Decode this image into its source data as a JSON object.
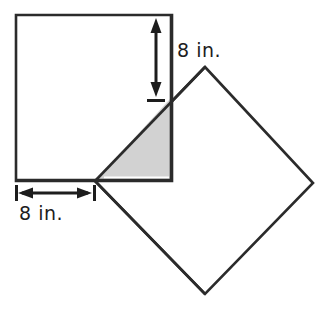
{
  "figure": {
    "background_color": "#ffffff",
    "stroke_color": "#2b2b2b",
    "shaded_fill_color": "#d2d2d2",
    "labels": {
      "vertical_dimension": "8 in.",
      "horizontal_dimension": "8 in."
    },
    "shapes": {
      "upright_square": {
        "name": "upright-square",
        "fill": "#ffffff",
        "stroke": "#2b2b2b",
        "points": "16,15 172,15 172,181 16,181"
      },
      "rotated_square": {
        "name": "rotated-square-diamond",
        "fill": "#ffffff",
        "stroke": "#2b2b2b",
        "points": "205,67 313,183 205,294 95,181"
      },
      "shaded_triangle": {
        "name": "shaded-overlap-triangle",
        "fill": "#d2d2d2",
        "stroke": "#2b2b2b",
        "points": "95,181 170,99 170,181"
      }
    },
    "dimension_lines": {
      "vertical": {
        "name": "vertical-dimension-arrow",
        "x": 156,
        "y_top": 20,
        "y_bottom": 95,
        "tick_y": 99,
        "tick_half_width": 9
      },
      "horizontal": {
        "name": "horizontal-dimension-arrow",
        "y": 193,
        "x_left": 20,
        "x_right": 90,
        "tick_left_x": 16,
        "tick_right_x": 95,
        "tick_half_height": 8
      }
    }
  }
}
